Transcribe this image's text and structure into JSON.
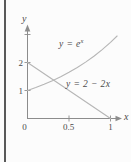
{
  "figure": {
    "background": "#fcfcfc",
    "page_rule_color": "#595959",
    "axis_color": "#8c8c8c",
    "curve_color": "#b6b6b6",
    "text_color": "#4a4a4a",
    "y_axis_label": "y",
    "x_axis_label": "x",
    "y_ticks": [
      {
        "value": 1,
        "label": "1"
      },
      {
        "value": 2,
        "label": "2"
      },
      {
        "value": 3,
        "label": ""
      }
    ],
    "x_ticks": [
      {
        "value": 0,
        "label": "0"
      },
      {
        "value": 0.5,
        "label": "0.5"
      },
      {
        "value": 1,
        "label": "1"
      }
    ],
    "curve1_label_base": "y = e",
    "curve1_label_sup": "x",
    "curve2_label": "y = 2 − 2x"
  },
  "chart_data": {
    "type": "line",
    "title": "",
    "xlabel": "x",
    "ylabel": "y",
    "xlim": [
      0,
      1.15
    ],
    "ylim": [
      0,
      3.3
    ],
    "grid": false,
    "legend_position": "none",
    "x_tick_values": [
      0,
      0.5,
      1
    ],
    "y_tick_values": [
      1,
      2
    ],
    "annotations": [
      {
        "text": "y = e^x",
        "near": [
          0.5,
          2.6
        ]
      },
      {
        "text": "y = 2 − 2x",
        "near": [
          0.62,
          1.25
        ]
      }
    ],
    "series": [
      {
        "name": "y = e^x",
        "points": [
          [
            0,
            1
          ],
          [
            0.1,
            1.105
          ],
          [
            0.2,
            1.221
          ],
          [
            0.3,
            1.35
          ],
          [
            0.4,
            1.492
          ],
          [
            0.5,
            1.649
          ],
          [
            0.6,
            1.822
          ],
          [
            0.7,
            2.014
          ],
          [
            0.8,
            2.226
          ],
          [
            0.9,
            2.46
          ],
          [
            1.0,
            2.718
          ],
          [
            1.08,
            2.945
          ]
        ]
      },
      {
        "name": "y = 2 − 2x",
        "points": [
          [
            0,
            2
          ],
          [
            1,
            0
          ]
        ]
      }
    ]
  }
}
